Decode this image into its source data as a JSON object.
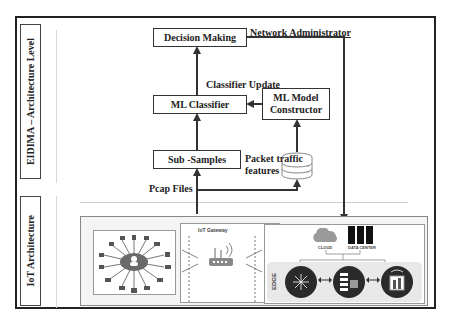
{
  "side_labels": {
    "top": "EIDIMA – Architecture Level",
    "bottom": "IoT Architecture"
  },
  "nodes": {
    "decision_making": "Decision Making",
    "ml_classifier": "ML Classifier",
    "ml_model_constructor_line1": "ML Model",
    "ml_model_constructor_line2": "Constructor",
    "sub_samples": "Sub -Samples",
    "database": "database-icon"
  },
  "edge_labels": {
    "network_administrator": "Network Administrator",
    "classifier_update": "Classifier Update",
    "packet_traffic_line1": "Packet traffic",
    "packet_traffic_line2": "features",
    "pcap_files": "Pcap Files"
  },
  "iot_panel": {
    "devices_hub": "cloud-user-hub-icon",
    "gateway_title": "IoT Gateway",
    "gateway_device": "router-icon",
    "cloud_label": "CLOUD",
    "datacenter_label": "DATA CENTER",
    "edge_label": "EDGE",
    "edge_nodes": [
      "edge-node-network-icon",
      "edge-node-server-icon",
      "edge-node-device-icon"
    ]
  },
  "colors": {
    "line": "#333333",
    "cloud": "#9a9a9a",
    "edge_band": "#e8e8e8",
    "edge_node": "#2a2a2a"
  }
}
